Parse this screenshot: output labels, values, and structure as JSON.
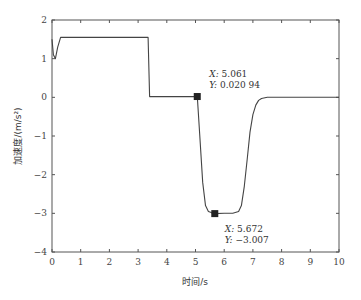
{
  "chart_data": {
    "type": "line",
    "title": "",
    "xlabel": "时间/s",
    "ylabel": "加速度/(m/s²)",
    "xlim": [
      0,
      10
    ],
    "ylim": [
      -4,
      2
    ],
    "xticks": [
      "0",
      "1",
      "2",
      "3",
      "4",
      "5",
      "6",
      "7",
      "8",
      "9",
      "10"
    ],
    "yticks": [
      "2",
      "1",
      "0",
      "-1",
      "-2",
      "-3",
      "-4"
    ],
    "grid": false,
    "legend": null,
    "series": [
      {
        "name": "acceleration",
        "x": [
          0,
          0.05,
          0.12,
          0.2,
          0.3,
          1.0,
          2.0,
          3.0,
          3.35,
          3.4,
          4.0,
          5.0,
          5.061,
          5.15,
          5.25,
          5.35,
          5.45,
          5.55,
          5.672,
          6.0,
          6.3,
          6.5,
          6.6,
          6.7,
          6.8,
          6.9,
          7.0,
          7.1,
          7.2,
          7.3,
          7.5,
          8.0,
          9.0,
          10.0
        ],
        "y": [
          1.5,
          1.1,
          1.0,
          1.3,
          1.55,
          1.55,
          1.55,
          1.55,
          1.55,
          0.02,
          0.02,
          0.02,
          0.02094,
          -1.0,
          -2.2,
          -2.8,
          -2.95,
          -2.98,
          -3.007,
          -3.0,
          -3.0,
          -2.95,
          -2.8,
          -2.3,
          -1.6,
          -0.9,
          -0.45,
          -0.2,
          -0.08,
          -0.03,
          0.0,
          0.0,
          0.0,
          0.0
        ]
      }
    ],
    "annotations": [
      {
        "x_label": "X:",
        "x_value": "5.061",
        "y_label": "Y:",
        "y_value": "0.020 94",
        "point": [
          5.061,
          0.02094
        ]
      },
      {
        "x_label": "X:",
        "x_value": "5.672",
        "y_label": "Y:",
        "y_value": "-3.007",
        "point": [
          5.672,
          -3.007
        ]
      }
    ]
  }
}
